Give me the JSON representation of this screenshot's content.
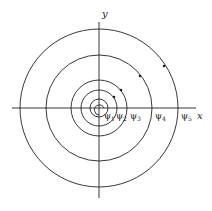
{
  "axes": {
    "x_label": "x",
    "y_label": "y"
  },
  "levels": [
    {
      "symbol": "ψ",
      "sub": "1"
    },
    {
      "symbol": "ψ",
      "sub": "2"
    },
    {
      "symbol": "ψ",
      "sub": "3"
    },
    {
      "symbol": "ψ",
      "sub": "4"
    },
    {
      "symbol": "ψ",
      "sub": "5"
    }
  ],
  "colors": {
    "stroke": "#222222",
    "background": "#ffffff"
  }
}
